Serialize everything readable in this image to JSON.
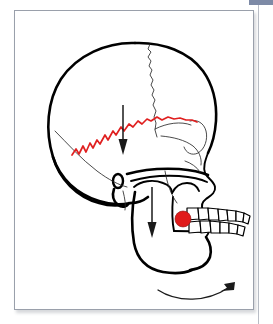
{
  "figure": {
    "title": "Lateral skull diagram with mandibular growth vectors",
    "frame": {
      "border_color": "#9aa0ab",
      "background_color": "#ffffff"
    }
  },
  "chrome": {
    "top_bar_color": "#7d8aa6",
    "right_rule_color": "#b9bdc6"
  },
  "colors": {
    "bone_outline": "#000000",
    "suture_thin": "#2a2a2a",
    "suture_highlight_red": "#e02020",
    "marker_red": "#e01b1b",
    "arrow": "#1a1a1a",
    "tooth_fill": "#ffffff"
  },
  "annotations": {
    "highlighted_suture": {
      "name": "squamous-suture-highlight",
      "color": "#e02020",
      "style": "jagged zigzag",
      "location": "temporal squamous / lambdoid border on cranial vault"
    },
    "arrows": [
      {
        "name": "cranial-downward-arrow",
        "direction": "down",
        "x": 121,
        "y_start": 104,
        "y_end": 150,
        "style": "straight line with solid triangular head"
      },
      {
        "name": "mandible-downward-arrow",
        "direction": "down",
        "x": 156,
        "y_start": 185,
        "y_end": 238,
        "style": "straight line with solid triangular head"
      },
      {
        "name": "mandibular-rotation-arrow",
        "direction": "clockwise-sweep-right",
        "style": "thin curved arc with open arrowhead",
        "from": [
          160,
          282
        ],
        "to": [
          238,
          265
        ]
      }
    ],
    "markers": [
      {
        "name": "molar-marker",
        "color": "#e01b1b",
        "shape": "circle",
        "location": "lower first molar region",
        "x": 184,
        "y": 214,
        "radius": 7
      }
    ]
  },
  "structures": [
    {
      "name": "cranial-vault",
      "label": "Cranial vault"
    },
    {
      "name": "frontal-bone",
      "label": "Frontal bone"
    },
    {
      "name": "coronal-suture",
      "label": "Coronal suture"
    },
    {
      "name": "temporal-bone",
      "label": "Temporal bone"
    },
    {
      "name": "external-auditory-meatus",
      "label": "External auditory meatus"
    },
    {
      "name": "orbit",
      "label": "Orbit"
    },
    {
      "name": "nasal-aperture",
      "label": "Nasal aperture"
    },
    {
      "name": "maxilla",
      "label": "Maxilla"
    },
    {
      "name": "mandible",
      "label": "Mandible"
    },
    {
      "name": "mandibular-ramus",
      "label": "Mandibular ramus"
    },
    {
      "name": "condyle",
      "label": "Condyle"
    },
    {
      "name": "upper-teeth-row",
      "label": "Upper dentition"
    },
    {
      "name": "lower-teeth-row",
      "label": "Lower dentition"
    },
    {
      "name": "occipital-bone",
      "label": "Occipital bone"
    }
  ],
  "teeth": {
    "upper_count": 8,
    "lower_count": 7
  }
}
